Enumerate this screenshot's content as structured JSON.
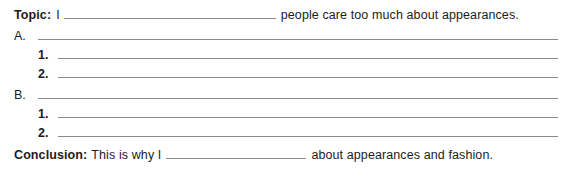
{
  "worksheet": {
    "topic_row": {
      "label": "Topic:",
      "lead_text": "I",
      "blank_value": "",
      "trailing_text": "people care too much about appearances."
    },
    "outline": [
      {
        "marker": "A.",
        "blank_value": "",
        "sub_items": [
          {
            "marker": "1.",
            "blank_value": ""
          },
          {
            "marker": "2.",
            "blank_value": ""
          }
        ]
      },
      {
        "marker": "B.",
        "blank_value": "",
        "sub_items": [
          {
            "marker": "1.",
            "blank_value": ""
          },
          {
            "marker": "2.",
            "blank_value": ""
          }
        ]
      }
    ],
    "conclusion_row": {
      "label": "Conclusion:",
      "lead_text": "This is why I",
      "blank_value": "",
      "trailing_text": "about appearances and fashion."
    },
    "colors": {
      "text": "#1c1c1c",
      "rule": "#8a8a8a",
      "background": "#ffffff"
    }
  }
}
